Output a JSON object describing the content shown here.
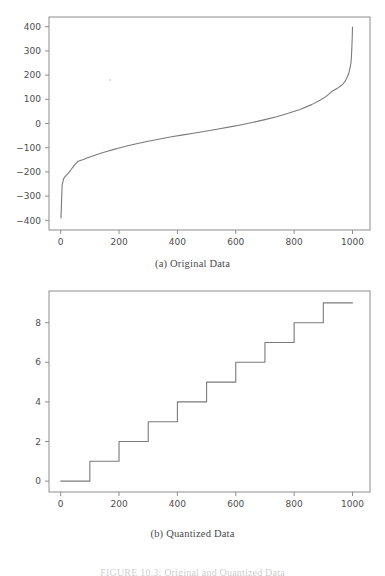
{
  "figure": {
    "caption": "FIGURE 10.3: Original and Quantized Data",
    "subcaption_a": "(a) Original Data",
    "subcaption_b": "(b) Quantized Data"
  },
  "chart_data": [
    {
      "id": "original-data",
      "type": "line",
      "title": "(a) Original Data",
      "xlabel": "",
      "ylabel": "",
      "xlim": [
        -40,
        1060
      ],
      "ylim": [
        -440,
        440
      ],
      "xticks": [
        0,
        200,
        400,
        600,
        800,
        1000
      ],
      "yticks": [
        -400,
        -300,
        -200,
        -100,
        0,
        100,
        200,
        300,
        400
      ],
      "grid": false,
      "legend": "none",
      "line_color": "#7a7a7a",
      "x": [
        1,
        5,
        10,
        15,
        20,
        25,
        30,
        35,
        40,
        50,
        60,
        70,
        80,
        90,
        100,
        120,
        140,
        160,
        180,
        200,
        230,
        260,
        300,
        340,
        380,
        420,
        460,
        500,
        540,
        580,
        620,
        660,
        700,
        740,
        780,
        820,
        860,
        890,
        910,
        930,
        950,
        965,
        975,
        982,
        988,
        992,
        995,
        997,
        999,
        1000
      ],
      "y": [
        -390,
        -255,
        -228,
        -219,
        -213,
        -207,
        -200,
        -192,
        -183,
        -168,
        -156,
        -152,
        -148,
        -143,
        -138,
        -130,
        -122,
        -115,
        -108,
        -101,
        -92,
        -84,
        -73,
        -64,
        -55,
        -47,
        -39,
        -31,
        -23,
        -14,
        -5,
        5,
        16,
        28,
        42,
        58,
        78,
        97,
        112,
        133,
        147,
        160,
        175,
        192,
        210,
        232,
        252,
        290,
        350,
        398
      ],
      "note": "Monotonically increasing sorted data, steep tails at both ends"
    },
    {
      "id": "quantized-data",
      "type": "line",
      "line_style": "step",
      "title": "(b) Quantized Data",
      "xlabel": "",
      "ylabel": "",
      "xlim": [
        -40,
        1060
      ],
      "ylim": [
        -0.55,
        9.6
      ],
      "xticks": [
        0,
        200,
        400,
        600,
        800,
        1000
      ],
      "yticks": [
        0,
        2,
        4,
        6,
        8
      ],
      "grid": false,
      "legend": "none",
      "line_color": "#7a7a7a",
      "x": [
        0,
        100,
        200,
        300,
        400,
        500,
        600,
        700,
        800,
        900,
        1000
      ],
      "y": [
        0,
        1,
        2,
        3,
        4,
        5,
        6,
        7,
        8,
        9,
        9
      ],
      "note": "Staircase: level increments by 1 every 100 samples, from 0 to 9"
    }
  ],
  "artifacts": {
    "speck_label": "scan-speck"
  }
}
